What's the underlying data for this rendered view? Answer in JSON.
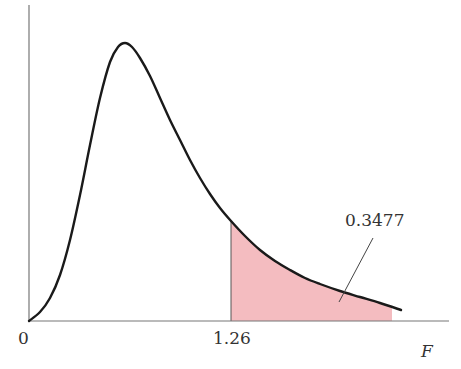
{
  "chart_data": {
    "type": "area",
    "title": "",
    "xlabel": "F",
    "ylabel": "",
    "distribution": "F-distribution probability density",
    "x_ticks": [
      {
        "value": 0,
        "label": "0"
      },
      {
        "value": 1.26,
        "label": "1.26"
      }
    ],
    "shaded_region": {
      "from": 1.26,
      "to": "right tail",
      "area": 0.3477,
      "label": "0.3477",
      "color": "#f4bcc0"
    },
    "curve_points_px": [
      [
        29,
        321
      ],
      [
        40,
        312
      ],
      [
        50,
        298
      ],
      [
        60,
        275
      ],
      [
        70,
        240
      ],
      [
        80,
        195
      ],
      [
        90,
        145
      ],
      [
        100,
        98
      ],
      [
        110,
        62
      ],
      [
        118,
        47
      ],
      [
        125,
        43
      ],
      [
        132,
        47
      ],
      [
        140,
        58
      ],
      [
        150,
        76
      ],
      [
        160,
        98
      ],
      [
        170,
        120
      ],
      [
        180,
        140
      ],
      [
        190,
        160
      ],
      [
        200,
        178
      ],
      [
        210,
        194
      ],
      [
        220,
        208
      ],
      [
        231,
        221
      ],
      [
        245,
        236
      ],
      [
        260,
        250
      ],
      [
        275,
        261
      ],
      [
        290,
        270
      ],
      [
        305,
        278
      ],
      [
        320,
        284
      ],
      [
        340,
        291
      ],
      [
        360,
        297
      ],
      [
        380,
        303
      ],
      [
        401,
        310
      ]
    ],
    "grid": false,
    "legend": null,
    "colors": {
      "curve": "#1a1a1a",
      "axes": "#555555",
      "shade": "#f4bcc0",
      "text": "#333333"
    }
  },
  "labels": {
    "origin": "0",
    "critical_value": "1.26",
    "axis_variable": "F",
    "area_value": "0.3477"
  }
}
